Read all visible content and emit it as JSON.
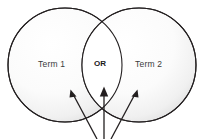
{
  "diagram": {
    "type": "venn-diagram",
    "left_circle": {
      "label": "Term 1",
      "cx": 65,
      "cy": 65,
      "r": 57,
      "stroke": "#231f20",
      "fill_center": "#ffffff",
      "fill_edge": "#e6e6e6"
    },
    "right_circle": {
      "label": "Term 2",
      "cx": 139,
      "cy": 65,
      "r": 57,
      "stroke": "#231f20",
      "fill_center": "#ffffff",
      "fill_edge": "#e6e6e6"
    },
    "intersection": {
      "label": "OR",
      "cx": 104,
      "cy": 65,
      "top_point_y": 22,
      "bottom_point_y": 108,
      "fill": "#ffffff"
    },
    "arrows": [
      {
        "name": "arrow-left",
        "direction": "up-left",
        "tail_x": 97,
        "tail_y": 138,
        "head_x": 71,
        "head_y": 91,
        "stroke": "#231f20"
      },
      {
        "name": "arrow-center",
        "direction": "up",
        "tail_x": 104,
        "tail_y": 138,
        "head_x": 104,
        "head_y": 88,
        "stroke": "#231f20"
      },
      {
        "name": "arrow-right",
        "direction": "up-right",
        "tail_x": 111,
        "tail_y": 138,
        "head_x": 137,
        "head_y": 91,
        "stroke": "#231f20"
      }
    ],
    "colors": {
      "background": "#ffffff",
      "outline": "#231f20",
      "label_text": "#3b3b3b",
      "operator_text": "#1a1a1a"
    }
  }
}
